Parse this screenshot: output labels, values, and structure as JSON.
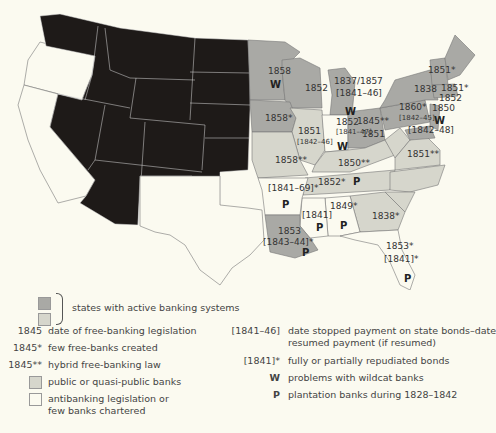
{
  "colors": {
    "background": "#fbfaf0",
    "territory_black": "#1e1a18",
    "active_dark": "#a9a9a5",
    "active_light": "#d6d6cc",
    "antibanking_white": "#fbfaf0",
    "border": "#777"
  },
  "map": {
    "labels": [
      {
        "id": "mn_date",
        "text": "1858",
        "x": 268,
        "y": 74
      },
      {
        "id": "mn_w",
        "text": "W",
        "x": 270,
        "y": 88,
        "bold": true
      },
      {
        "id": "wi_date",
        "text": "1852",
        "x": 305,
        "y": 91
      },
      {
        "id": "mi_date",
        "text": "1837/1857",
        "x": 334,
        "y": 84
      },
      {
        "id": "mi_stop",
        "text": "[1841–46]",
        "x": 336,
        "y": 96
      },
      {
        "id": "mi_w",
        "text": "W",
        "x": 345,
        "y": 115,
        "bold": true
      },
      {
        "id": "ia_date",
        "text": "1858*",
        "x": 265,
        "y": 121
      },
      {
        "id": "il_date",
        "text": "1851",
        "x": 298,
        "y": 134
      },
      {
        "id": "il_stop",
        "text": "[1842–46]",
        "x": 297,
        "y": 144,
        "small": true
      },
      {
        "id": "in_date",
        "text": "1852",
        "x": 336,
        "y": 125
      },
      {
        "id": "in_stop",
        "text": "[1841–47]",
        "x": 336,
        "y": 134,
        "small": true
      },
      {
        "id": "in_w",
        "text": "W",
        "x": 337,
        "y": 150,
        "bold": true
      },
      {
        "id": "oh_date",
        "text": "1845**",
        "x": 357,
        "y": 124
      },
      {
        "id": "oh_date2",
        "text": "1851",
        "x": 362,
        "y": 137
      },
      {
        "id": "mo_date",
        "text": "1858**",
        "x": 275,
        "y": 163
      },
      {
        "id": "ky_date",
        "text": "1850**",
        "x": 338,
        "y": 166
      },
      {
        "id": "va_date",
        "text": "1851**",
        "x": 407,
        "y": 157
      },
      {
        "id": "tn_date",
        "text": "1852*",
        "x": 318,
        "y": 185
      },
      {
        "id": "tn_p",
        "text": "P",
        "x": 353,
        "y": 185,
        "bold": true
      },
      {
        "id": "ar_stop",
        "text": "[1841–69]*",
        "x": 268,
        "y": 191
      },
      {
        "id": "ar_p",
        "text": "P",
        "x": 282,
        "y": 208,
        "bold": true
      },
      {
        "id": "ms_stop",
        "text": "[1841]",
        "x": 302,
        "y": 218
      },
      {
        "id": "ms_p",
        "text": "P",
        "x": 316,
        "y": 231,
        "bold": true
      },
      {
        "id": "al_date",
        "text": "1849*",
        "x": 330,
        "y": 209
      },
      {
        "id": "al_p",
        "text": "P",
        "x": 340,
        "y": 229,
        "bold": true
      },
      {
        "id": "ga_date",
        "text": "1838*",
        "x": 372,
        "y": 219
      },
      {
        "id": "la_date",
        "text": "1853",
        "x": 278,
        "y": 234
      },
      {
        "id": "la_stop",
        "text": "[1843–44]*",
        "x": 263,
        "y": 245
      },
      {
        "id": "la_p",
        "text": "P",
        "x": 302,
        "y": 256,
        "bold": true
      },
      {
        "id": "fl_date",
        "text": "1853*",
        "x": 386,
        "y": 249
      },
      {
        "id": "fl_stop",
        "text": "[1841]*",
        "x": 384,
        "y": 262
      },
      {
        "id": "fl_p",
        "text": "P",
        "x": 404,
        "y": 282,
        "bold": true
      },
      {
        "id": "ny_date",
        "text": "1838",
        "x": 414,
        "y": 92
      },
      {
        "id": "pa_date",
        "text": "1860*",
        "x": 399,
        "y": 110
      },
      {
        "id": "pa_stop",
        "text": "[1842–45]",
        "x": 399,
        "y": 120,
        "small": true
      },
      {
        "id": "nj_date",
        "text": "1850",
        "x": 432,
        "y": 111
      },
      {
        "id": "nj_w",
        "text": "W",
        "x": 434,
        "y": 124,
        "bold": true
      },
      {
        "id": "md_stop",
        "text": "[1842–48]",
        "x": 408,
        "y": 133
      },
      {
        "id": "vt_date",
        "text": "1851*",
        "x": 428,
        "y": 73
      },
      {
        "id": "ma_date",
        "text": "1851*",
        "x": 441,
        "y": 91
      },
      {
        "id": "ct_date",
        "text": "1852",
        "x": 439,
        "y": 101
      }
    ]
  },
  "legend": {
    "active_systems": "states with active banking systems",
    "left": [
      {
        "key": "1845",
        "text": "date of free-banking legislation"
      },
      {
        "key": "1845*",
        "text": "few free-banks created"
      },
      {
        "key": "1845**",
        "text": "hybrid free-banking law"
      },
      {
        "swatch": "light",
        "text": "public or quasi-public banks"
      },
      {
        "swatch": "white",
        "text": "antibanking legislation or",
        "text2": "few banks chartered"
      }
    ],
    "right": [
      {
        "key": "[1841–46]",
        "text": "date stopped payment on state bonds–date",
        "text2": "resumed payment (if resumed)"
      },
      {
        "key": "[1841]*",
        "text": "fully or partially repudiated bonds"
      },
      {
        "key": "W",
        "text": "problems with wildcat banks",
        "bold": true
      },
      {
        "key": "P",
        "text": "plantation banks during 1828–1842",
        "bold": true
      }
    ]
  }
}
